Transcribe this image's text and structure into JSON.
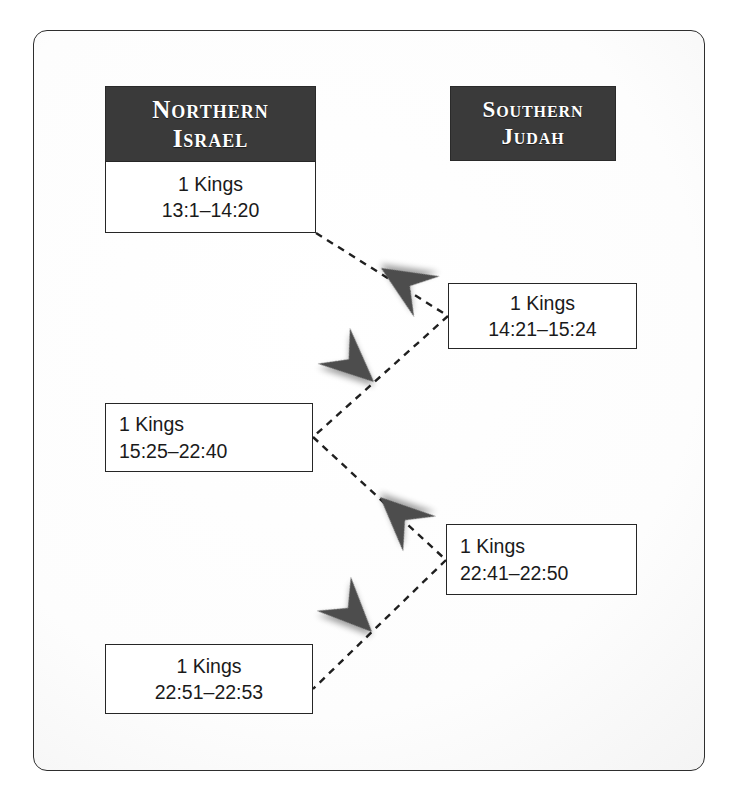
{
  "diagram": {
    "book": "1 Kings",
    "colors": {
      "header_background": "#3a3a3a",
      "header_text": "#ffffff",
      "box_border": "#262626",
      "box_background": "#ffffff",
      "arrow_fill": "#4a4a4a",
      "connector_line": "#1f1f1f",
      "frame_border": "#2e2e2e"
    },
    "columns": [
      {
        "id": "northern-israel",
        "header_line_1": "Northern",
        "header_line_2": "Israel"
      },
      {
        "id": "southern-judah",
        "header_line_1": "Southern",
        "header_line_2": "Judah"
      }
    ],
    "boxes": [
      {
        "id": "north-1",
        "column": "northern-israel",
        "order": 1,
        "book": "1 Kings",
        "reference": "13:1–14:20",
        "align": "center"
      },
      {
        "id": "south-1",
        "column": "southern-judah",
        "order": 2,
        "book": "1 Kings",
        "reference": "14:21–15:24",
        "align": "center"
      },
      {
        "id": "north-2",
        "column": "northern-israel",
        "order": 3,
        "book": "1 Kings",
        "reference": "15:25–22:40",
        "align": "left"
      },
      {
        "id": "south-2",
        "column": "southern-judah",
        "order": 4,
        "book": "1 Kings",
        "reference": "22:41–22:50",
        "align": "left"
      },
      {
        "id": "north-3",
        "column": "northern-israel",
        "order": 5,
        "book": "1 Kings",
        "reference": "22:51–22:53",
        "align": "center"
      }
    ],
    "connectors": [
      {
        "id": "c1",
        "from": "north-1",
        "to": "south-1",
        "style": "dashed",
        "arrow": "barbed-dart"
      },
      {
        "id": "c2",
        "from": "south-1",
        "to": "north-2",
        "style": "dashed",
        "arrow": "barbed-dart"
      },
      {
        "id": "c3",
        "from": "north-2",
        "to": "south-2",
        "style": "dashed",
        "arrow": "barbed-dart"
      },
      {
        "id": "c4",
        "from": "south-2",
        "to": "north-3",
        "style": "dashed",
        "arrow": "barbed-dart"
      }
    ]
  }
}
